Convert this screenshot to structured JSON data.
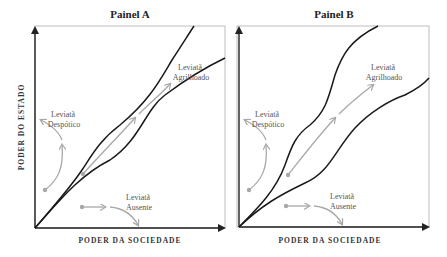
{
  "panels": [
    {
      "title": "Painel A",
      "x_label": "PODER DA SOCIEDADE",
      "y_label": "PODER DO ESTADO",
      "regions": {
        "despotic": [
          "Leviatã",
          "Despótico"
        ],
        "shackled": [
          "Leviatã",
          "Agrilhoado"
        ],
        "absent": [
          "Leviatã",
          "Ausente"
        ]
      }
    },
    {
      "title": "Painel B",
      "x_label": "PODER DA SOCIEDADE",
      "y_label": "",
      "regions": {
        "despotic": [
          "Leviatã",
          "Despótico"
        ],
        "shackled": [
          "Leviatã",
          "Agrilhoado"
        ],
        "absent": [
          "Leviatã",
          "Ausente"
        ]
      }
    }
  ],
  "colors": {
    "corridor": "#1a1a1a",
    "trajectory": "#a8a8a8",
    "frame": "#bdbdbd"
  }
}
